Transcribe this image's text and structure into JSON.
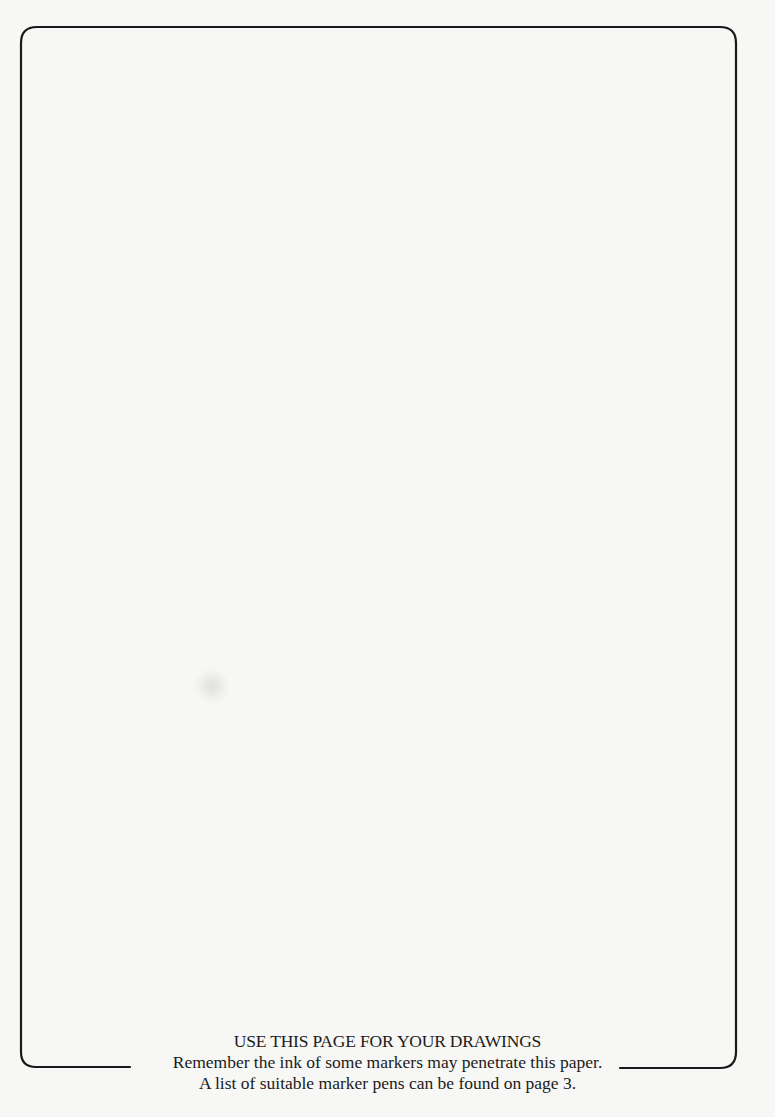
{
  "page": {
    "background_color": "#f7f7f5",
    "frame_color": "#1a1a1a"
  },
  "footer": {
    "heading": "USE THIS PAGE FOR YOUR DRAWINGS",
    "line_2": "Remember the ink of some markers may penetrate this paper.",
    "line_3": "A list of suitable marker pens can be found on page 3."
  }
}
